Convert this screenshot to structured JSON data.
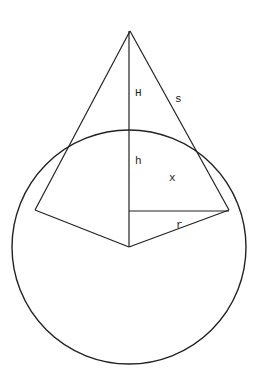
{
  "diagram": {
    "type": "geometry",
    "stroke_color": "#222222",
    "background": "#ffffff",
    "circle": {
      "cx": 129,
      "cy": 247,
      "r": 117
    },
    "apex": {
      "x": 130,
      "y": 31
    },
    "tangent_left": {
      "x": 35,
      "y": 210
    },
    "tangent_right": {
      "x": 229,
      "y": 210
    },
    "labels": {
      "H": "H",
      "s": "s",
      "h": "h",
      "x": "x",
      "r": "r"
    }
  }
}
